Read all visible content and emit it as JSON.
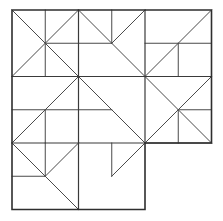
{
  "figure": {
    "canvas": {
      "width": 223,
      "height": 221
    },
    "colors": {
      "background": "#ffffff",
      "stroke": "#3a3a3a",
      "stroke_outline": "#2e2e2e",
      "stroke_thin": "#4a4a4a"
    },
    "stroke_widths": {
      "outline": 1.6,
      "grid": 1.2,
      "inner": 1.0
    },
    "grid": {
      "x_positions": [
        12,
        78.5,
        145,
        211.5
      ],
      "y_positions": [
        10,
        76.5,
        143,
        209.5
      ],
      "columns": 3,
      "rows": 3,
      "omitted_cells": [
        "row3-col3"
      ]
    },
    "outline_points": "12,10 211.5,10 211.5,143 145,143 145,209.5 12,209.5",
    "grid_lines": [
      {
        "name": "vertical-grid-1",
        "x1": 78.5,
        "y1": 10,
        "x2": 78.5,
        "y2": 209.5
      },
      {
        "name": "vertical-grid-2",
        "x1": 145,
        "y1": 10,
        "x2": 145,
        "y2": 143
      },
      {
        "name": "horizontal-grid-1",
        "x1": 12,
        "y1": 76.5,
        "x2": 211.5,
        "y2": 76.5
      },
      {
        "name": "horizontal-grid-2",
        "x1": 12,
        "y1": 143,
        "x2": 211.5,
        "y2": 143
      }
    ],
    "cells": [
      {
        "name": "cell-top-left",
        "row": 1,
        "col": 1,
        "bounds": {
          "x": 12,
          "y": 10,
          "w": 66.5,
          "h": 66.5
        },
        "segments": [
          {
            "name": "diagonal-tl-br",
            "x1": 12,
            "y1": 10,
            "x2": 78.5,
            "y2": 76.5
          },
          {
            "name": "diagonal-bl-tr",
            "x1": 12,
            "y1": 76.5,
            "x2": 78.5,
            "y2": 10
          },
          {
            "name": "vertical-upper-half",
            "x1": 45.25,
            "y1": 10,
            "x2": 45.25,
            "y2": 76.5
          },
          {
            "name": "horizontal-right-half",
            "x1": 45.25,
            "y1": 43.25,
            "x2": 78.5,
            "y2": 43.25
          }
        ]
      },
      {
        "name": "cell-top-center",
        "row": 1,
        "col": 2,
        "bounds": {
          "x": 78.5,
          "y": 10,
          "w": 66.5,
          "h": 66.5
        },
        "segments": [
          {
            "name": "diagonal-tl-br",
            "x1": 78.5,
            "y1": 10,
            "x2": 145,
            "y2": 76.5
          },
          {
            "name": "diagonal-tr-center",
            "x1": 145,
            "y1": 10,
            "x2": 111.75,
            "y2": 43.25
          },
          {
            "name": "vertical-upper-half",
            "x1": 111.75,
            "y1": 10,
            "x2": 111.75,
            "y2": 43.25
          },
          {
            "name": "horizontal-left-half",
            "x1": 78.5,
            "y1": 43.25,
            "x2": 111.75,
            "y2": 43.25
          }
        ]
      },
      {
        "name": "cell-top-right",
        "row": 1,
        "col": 3,
        "bounds": {
          "x": 145,
          "y": 10,
          "w": 66.5,
          "h": 66.5
        },
        "segments": [
          {
            "name": "diagonal-bl-tr",
            "x1": 145,
            "y1": 76.5,
            "x2": 211.5,
            "y2": 10
          },
          {
            "name": "horizontal-mid",
            "x1": 145,
            "y1": 43.25,
            "x2": 211.5,
            "y2": 43.25
          },
          {
            "name": "vertical-lower-half",
            "x1": 178.25,
            "y1": 43.25,
            "x2": 178.25,
            "y2": 76.5
          }
        ]
      },
      {
        "name": "cell-middle-left",
        "row": 2,
        "col": 1,
        "bounds": {
          "x": 12,
          "y": 76.5,
          "w": 66.5,
          "h": 66.5
        },
        "segments": [
          {
            "name": "diagonal-bl-tr",
            "x1": 12,
            "y1": 143,
            "x2": 78.5,
            "y2": 76.5
          },
          {
            "name": "horizontal-mid",
            "x1": 12,
            "y1": 109.75,
            "x2": 78.5,
            "y2": 109.75
          },
          {
            "name": "vertical-lower-half",
            "x1": 45.25,
            "y1": 109.75,
            "x2": 45.25,
            "y2": 143
          }
        ]
      },
      {
        "name": "cell-middle-center",
        "row": 2,
        "col": 2,
        "bounds": {
          "x": 78.5,
          "y": 76.5,
          "w": 66.5,
          "h": 66.5
        },
        "segments": [
          {
            "name": "diagonal-tl-br",
            "x1": 78.5,
            "y1": 76.5,
            "x2": 145,
            "y2": 143
          },
          {
            "name": "horizontal-left-half",
            "x1": 78.5,
            "y1": 109.75,
            "x2": 111.75,
            "y2": 109.75
          }
        ]
      },
      {
        "name": "cell-middle-right",
        "row": 2,
        "col": 3,
        "bounds": {
          "x": 145,
          "y": 76.5,
          "w": 66.5,
          "h": 66.5
        },
        "segments": [
          {
            "name": "diagonal-tl-br",
            "x1": 145,
            "y1": 76.5,
            "x2": 211.5,
            "y2": 143
          },
          {
            "name": "diagonal-bl-tr",
            "x1": 145,
            "y1": 143,
            "x2": 211.5,
            "y2": 76.5
          },
          {
            "name": "horizontal-right-half",
            "x1": 178.25,
            "y1": 109.75,
            "x2": 211.5,
            "y2": 109.75
          },
          {
            "name": "vertical-lower-half",
            "x1": 178.25,
            "y1": 109.75,
            "x2": 178.25,
            "y2": 143
          }
        ]
      },
      {
        "name": "cell-bottom-left",
        "row": 3,
        "col": 1,
        "bounds": {
          "x": 12,
          "y": 143,
          "w": 66.5,
          "h": 66.5
        },
        "segments": [
          {
            "name": "diagonal-tl-br",
            "x1": 12,
            "y1": 143,
            "x2": 78.5,
            "y2": 209.5
          },
          {
            "name": "diagonal-tr-center",
            "x1": 78.5,
            "y1": 143,
            "x2": 45.25,
            "y2": 176.25
          },
          {
            "name": "vertical-upper-half",
            "x1": 45.25,
            "y1": 143,
            "x2": 45.25,
            "y2": 176.25
          },
          {
            "name": "horizontal-left-half",
            "x1": 12,
            "y1": 176.25,
            "x2": 45.25,
            "y2": 176.25
          }
        ]
      },
      {
        "name": "cell-bottom-center",
        "row": 3,
        "col": 2,
        "bounds": {
          "x": 78.5,
          "y": 143,
          "w": 66.5,
          "h": 66.5
        },
        "segments": [
          {
            "name": "vertical-stub",
            "x1": 111.75,
            "y1": 143,
            "x2": 111.75,
            "y2": 176.25
          },
          {
            "name": "diagonal-center-tr",
            "x1": 111.75,
            "y1": 176.25,
            "x2": 145,
            "y2": 143
          }
        ]
      }
    ]
  }
}
